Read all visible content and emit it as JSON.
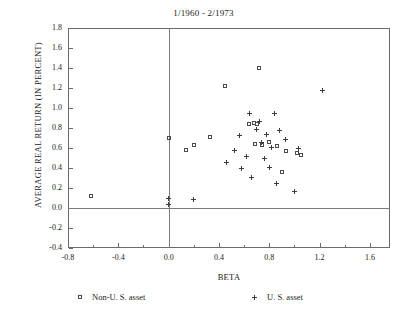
{
  "chart_data": {
    "type": "scatter",
    "title": "1/1960 - 2/1973",
    "xlabel": "BETA",
    "ylabel": "AVERAGE REAL RETURN (IN PERCENT)",
    "xlim": [
      -0.8,
      1.76
    ],
    "ylim": [
      -0.4,
      1.8
    ],
    "xticks": [
      -0.8,
      -0.4,
      0.0,
      0.4,
      0.8,
      1.2,
      1.6
    ],
    "xtick_labels": [
      "-0.8",
      "-0.4",
      "0.0",
      "0.4",
      "0.8",
      "1.2",
      "1.6"
    ],
    "xminor_ticks": [
      -0.6,
      -0.2,
      0.2,
      0.6,
      1.0,
      1.4
    ],
    "yticks": [
      -0.4,
      -0.2,
      0.0,
      0.2,
      0.4,
      0.6,
      0.8,
      1.0,
      1.2,
      1.4,
      1.6,
      1.8
    ],
    "ytick_labels": [
      "-0.4",
      "-0.2",
      "0.0",
      "0.2",
      "0.4",
      "0.6",
      "0.8",
      "1.0",
      "1.2",
      "1.4",
      "1.6",
      "1.8"
    ],
    "grid": false,
    "reference_lines": [
      {
        "axis": "x",
        "value": 0.0
      },
      {
        "axis": "y",
        "value": 0.0
      }
    ],
    "legend_position": "below-axis",
    "series": [
      {
        "name": "Non-U. S. asset",
        "marker": "square",
        "color": "#4a4a4a",
        "points": [
          [
            -0.62,
            0.12
          ],
          [
            0.0,
            0.7
          ],
          [
            0.14,
            0.58
          ],
          [
            0.2,
            0.63
          ],
          [
            0.33,
            0.71
          ],
          [
            0.45,
            1.22
          ],
          [
            0.72,
            1.4
          ],
          [
            0.64,
            0.84
          ],
          [
            0.68,
            0.85
          ],
          [
            0.7,
            0.84
          ],
          [
            0.69,
            0.64
          ],
          [
            0.74,
            0.63
          ],
          [
            0.8,
            0.66
          ],
          [
            0.86,
            0.62
          ],
          [
            0.9,
            0.36
          ],
          [
            0.93,
            0.57
          ],
          [
            1.02,
            0.55
          ],
          [
            1.05,
            0.53
          ]
        ]
      },
      {
        "name": "U. S. asset",
        "marker": "plus",
        "color": "#3d3d3d",
        "points": [
          [
            0.0,
            0.1
          ],
          [
            0.0,
            0.04
          ],
          [
            0.2,
            0.09
          ],
          [
            0.46,
            0.46
          ],
          [
            0.52,
            0.58
          ],
          [
            0.56,
            0.73
          ],
          [
            0.58,
            0.4
          ],
          [
            0.62,
            0.52
          ],
          [
            0.64,
            0.95
          ],
          [
            0.66,
            0.31
          ],
          [
            0.7,
            0.79
          ],
          [
            0.72,
            0.87
          ],
          [
            0.74,
            0.66
          ],
          [
            0.76,
            0.5
          ],
          [
            0.78,
            0.74
          ],
          [
            0.8,
            0.41
          ],
          [
            0.82,
            0.61
          ],
          [
            0.84,
            0.95
          ],
          [
            0.86,
            0.25
          ],
          [
            0.88,
            0.78
          ],
          [
            0.93,
            0.69
          ],
          [
            1.0,
            0.17
          ],
          [
            1.03,
            0.6
          ],
          [
            1.22,
            1.18
          ]
        ]
      }
    ]
  },
  "legend": {
    "nonus_label": "Non-U. S. asset",
    "us_label": "U. S. asset"
  }
}
